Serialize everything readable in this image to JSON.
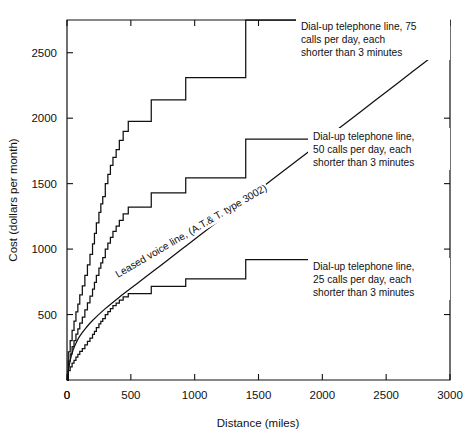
{
  "chart_data": {
    "type": "line",
    "title": "",
    "xlabel": "Distance (miles)",
    "ylabel": "Cost (dollars per month)",
    "xlim": [
      0,
      3000
    ],
    "ylim": [
      0,
      2750
    ],
    "xticks": [
      0,
      500,
      1000,
      1500,
      2000,
      2500,
      3000
    ],
    "xticklabels": [
      "0",
      "500",
      "1000",
      "1500",
      "2000",
      "2500",
      "3000"
    ],
    "yticks": [
      500,
      1000,
      1500,
      2000,
      2500
    ],
    "yticklabels": [
      "500",
      "1000",
      "1500",
      "2000",
      "2500"
    ],
    "grid": false,
    "legend": "annotations-inline",
    "series": [
      {
        "name": "Dial-up telephone line, 75 calls per day, each shorter than 3 minutes",
        "style": "step",
        "points": [
          [
            0,
            0
          ],
          [
            10,
            215
          ],
          [
            25,
            300
          ],
          [
            40,
            380
          ],
          [
            55,
            450
          ],
          [
            70,
            520
          ],
          [
            85,
            580
          ],
          [
            100,
            650
          ],
          [
            120,
            720
          ],
          [
            140,
            800
          ],
          [
            160,
            880
          ],
          [
            180,
            960
          ],
          [
            200,
            1040
          ],
          [
            215,
            1120
          ],
          [
            230,
            1200
          ],
          [
            250,
            1280
          ],
          [
            265,
            1345
          ],
          [
            280,
            1400
          ],
          [
            300,
            1500
          ],
          [
            320,
            1570
          ],
          [
            340,
            1640
          ],
          [
            360,
            1700
          ],
          [
            385,
            1760
          ],
          [
            410,
            1830
          ],
          [
            440,
            1900
          ],
          [
            480,
            1975
          ],
          [
            660,
            1975
          ],
          [
            660,
            2140
          ],
          [
            930,
            2140
          ],
          [
            930,
            2310
          ],
          [
            1400,
            2310
          ],
          [
            1400,
            2750
          ],
          [
            3000,
            2750
          ]
        ]
      },
      {
        "name": "Dial-up telephone line, 50 calls per day, each shorter than 3 minutes",
        "style": "step",
        "points": [
          [
            0,
            0
          ],
          [
            10,
            145
          ],
          [
            25,
            200
          ],
          [
            40,
            255
          ],
          [
            55,
            300
          ],
          [
            70,
            350
          ],
          [
            85,
            390
          ],
          [
            100,
            435
          ],
          [
            120,
            480
          ],
          [
            140,
            535
          ],
          [
            160,
            590
          ],
          [
            180,
            640
          ],
          [
            200,
            695
          ],
          [
            215,
            745
          ],
          [
            230,
            800
          ],
          [
            250,
            855
          ],
          [
            265,
            895
          ],
          [
            280,
            935
          ],
          [
            300,
            1000
          ],
          [
            320,
            1045
          ],
          [
            340,
            1090
          ],
          [
            360,
            1135
          ],
          [
            385,
            1175
          ],
          [
            410,
            1220
          ],
          [
            440,
            1270
          ],
          [
            480,
            1320
          ],
          [
            660,
            1320
          ],
          [
            660,
            1430
          ],
          [
            930,
            1430
          ],
          [
            930,
            1545
          ],
          [
            1400,
            1545
          ],
          [
            1400,
            1840
          ],
          [
            3000,
            1840
          ]
        ]
      },
      {
        "name": "Dial-up telephone line, 25 calls per day, each shorter than 3 minutes",
        "style": "step",
        "points": [
          [
            0,
            0
          ],
          [
            10,
            72
          ],
          [
            25,
            100
          ],
          [
            40,
            128
          ],
          [
            55,
            150
          ],
          [
            70,
            175
          ],
          [
            85,
            195
          ],
          [
            100,
            218
          ],
          [
            120,
            240
          ],
          [
            140,
            268
          ],
          [
            160,
            295
          ],
          [
            180,
            320
          ],
          [
            200,
            348
          ],
          [
            215,
            372
          ],
          [
            230,
            400
          ],
          [
            250,
            428
          ],
          [
            265,
            448
          ],
          [
            280,
            468
          ],
          [
            300,
            500
          ],
          [
            320,
            522
          ],
          [
            340,
            545
          ],
          [
            360,
            568
          ],
          [
            385,
            588
          ],
          [
            410,
            610
          ],
          [
            440,
            635
          ],
          [
            480,
            660
          ],
          [
            660,
            660
          ],
          [
            660,
            715
          ],
          [
            930,
            715
          ],
          [
            930,
            772
          ],
          [
            1400,
            772
          ],
          [
            1400,
            920
          ],
          [
            3000,
            920
          ]
        ]
      },
      {
        "name": "Leased voice line, (A.T.& T. type 3002)",
        "style": "smooth",
        "points": [
          [
            0,
            0
          ],
          [
            25,
            150
          ],
          [
            50,
            235
          ],
          [
            75,
            290
          ],
          [
            100,
            335
          ],
          [
            150,
            400
          ],
          [
            200,
            455
          ],
          [
            300,
            545
          ],
          [
            400,
            625
          ],
          [
            500,
            700
          ],
          [
            600,
            775
          ],
          [
            700,
            850
          ],
          [
            800,
            925
          ],
          [
            900,
            1000
          ],
          [
            1000,
            1075
          ],
          [
            1200,
            1225
          ],
          [
            1400,
            1375
          ],
          [
            1600,
            1525
          ],
          [
            1800,
            1675
          ],
          [
            2000,
            1825
          ],
          [
            2200,
            1975
          ],
          [
            2400,
            2125
          ],
          [
            2600,
            2275
          ],
          [
            2800,
            2425
          ],
          [
            3000,
            2575
          ]
        ]
      }
    ],
    "annotations": [
      {
        "name": "dial-up-75-annotation",
        "lines": [
          "Dial-up telephone line, 75",
          "calls per day, each",
          "shorter than 3 minutes"
        ]
      },
      {
        "name": "dial-up-50-annotation",
        "lines": [
          "Dial-up telephone line,",
          "50 calls per day, each",
          "shorter than 3 minutes"
        ]
      },
      {
        "name": "dial-up-25-annotation",
        "lines": [
          "Dial-up telephone line,",
          "25 calls per day, each",
          "shorter than 3 minutes"
        ]
      },
      {
        "name": "leased-voice-line-label",
        "text": "Leased voice line, (A.T.& T. type 3002)"
      }
    ],
    "colors": {
      "line": "#111111",
      "background": "#ffffff",
      "axis": "#111111"
    }
  }
}
